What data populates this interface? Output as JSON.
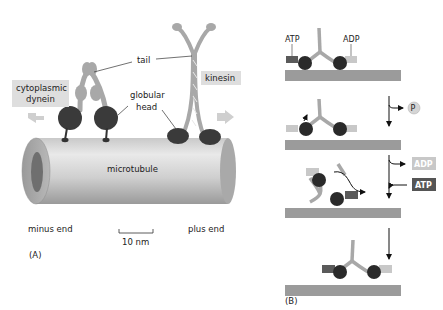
{
  "panel_a": {
    "label": "(A)",
    "tail_label": "tail",
    "globular_head_label_1": "globular",
    "globular_head_label_2": "head",
    "dynein_label_1": "cytoplasmic",
    "dynein_label_2": "dynein",
    "kinesin_label": "kinesin",
    "microtubule_label": "microtubule",
    "minus_end_label": "minus end",
    "plus_end_label": "plus end",
    "scale_bar_label": "10 nm"
  },
  "panel_b": {
    "label": "(B)",
    "atp_label": "ATP",
    "adp_label": "ADP",
    "phosphate_label": "P",
    "adp_release_label": "ADP",
    "atp_bind_label": "ATP"
  },
  "colors": {
    "motor_head": "#333333",
    "motor_stalk": "#a8a8a8",
    "microtubule_light": "#d8d8d8",
    "microtubule_dark": "#8f8f8f",
    "track": "#9b9b9b",
    "label_box": "#dedede",
    "atp_box": "#5a5a5a",
    "adp_box": "#c8c8c8"
  }
}
